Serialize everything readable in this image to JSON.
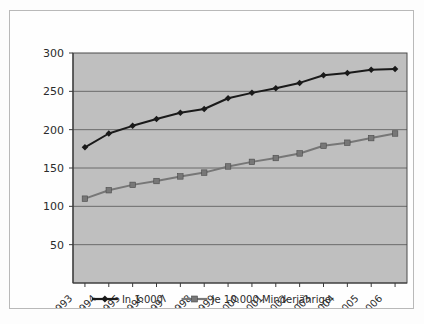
{
  "chart_data": {
    "type": "line",
    "title": "",
    "subtitle": "",
    "xlabel": "",
    "ylabel": "",
    "x": [
      "1993",
      "1994",
      "1995",
      "1996",
      "1997",
      "1998",
      "1999",
      "2000",
      "2001",
      "2002",
      "2003",
      "2004",
      "2005",
      "2006"
    ],
    "categories": [
      "1993",
      "1994",
      "1995",
      "1996",
      "1997",
      "1998",
      "1999",
      "2000",
      "2001",
      "2002",
      "2003",
      "2004",
      "2005",
      "2006"
    ],
    "series": [
      {
        "name": "In 1.000",
        "marker": "diamond",
        "color": "#1a1a1a",
        "values": [
          177,
          195,
          205,
          214,
          222,
          227,
          241,
          248,
          254,
          261,
          271,
          274,
          278,
          279
        ]
      },
      {
        "name": "Je 10.000 Minderjährige",
        "marker": "square",
        "color": "#777777",
        "values": [
          110,
          121,
          128,
          133,
          139,
          144,
          152,
          158,
          163,
          169,
          179,
          183,
          189,
          195
        ]
      }
    ],
    "ylim": [
      0,
      300
    ],
    "yticks": [
      50,
      100,
      150,
      200,
      250,
      300
    ],
    "ytick_labels": [
      "50",
      "100",
      "150",
      "200",
      "250",
      "300"
    ],
    "xtick_labels": [
      "1993",
      "1994",
      "1995",
      "1996",
      "1997",
      "1998",
      "1999",
      "2000",
      "2001",
      "2002",
      "2003",
      "2004",
      "2005",
      "2006"
    ],
    "grid": {
      "horizontal": true,
      "vertical": false,
      "color": "#555555"
    },
    "legend": {
      "position": "bottom",
      "entries": [
        {
          "label": "In 1.000",
          "marker": "diamond",
          "color": "#1a1a1a"
        },
        {
          "label": "Je 10.000 Minderjährige",
          "marker": "square",
          "color": "#777777"
        }
      ]
    },
    "plot_area": {
      "background_color": "#bfbfbf",
      "border_color": "#4a4a4a"
    },
    "figure": {
      "background_color": "#fefefe",
      "border_color": "#b9b9b9"
    }
  }
}
